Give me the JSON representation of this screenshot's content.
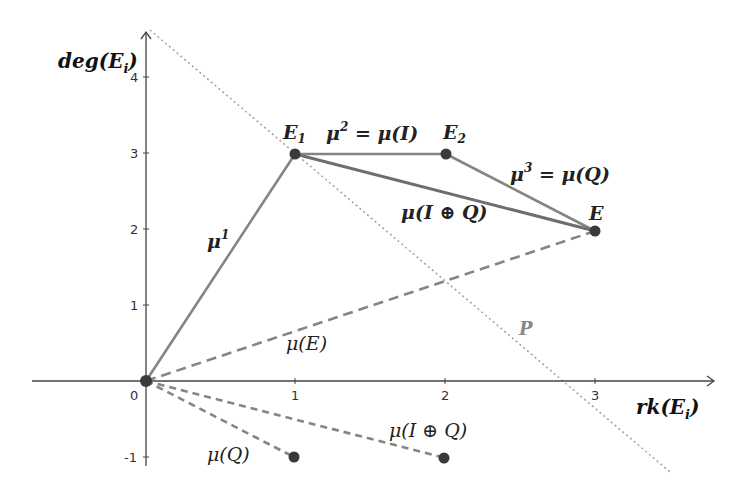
{
  "diagram": {
    "axes": {
      "x_label": "rk(E_i)",
      "x_label_main": "rk(E",
      "x_label_sub": "i",
      "x_label_close": ")",
      "y_label_main": "deg(E",
      "y_label_sub": "i",
      "y_label_close": ")",
      "x_ticks": [
        "0",
        "1",
        "2",
        "3"
      ],
      "y_ticks": [
        "4",
        "3",
        "2",
        "1",
        "-1"
      ]
    },
    "points": [
      {
        "name": "0",
        "x": 0,
        "y": 0
      },
      {
        "name": "E1",
        "x": 1,
        "y": 3,
        "label_main": "E",
        "label_sub": "1"
      },
      {
        "name": "E2",
        "x": 2,
        "y": 3,
        "label_main": "E",
        "label_sub": "2"
      },
      {
        "name": "E",
        "x": 3,
        "y": 2,
        "label_main": "E"
      },
      {
        "name": "mu(Q)",
        "x": 1,
        "y": -1
      },
      {
        "name": "mu(I+Q)",
        "x": 2,
        "y": -1
      }
    ],
    "segments": [
      {
        "from": [
          0,
          0
        ],
        "to": [
          1,
          3
        ],
        "style": "solid",
        "label": "μ¹"
      },
      {
        "from": [
          1,
          3
        ],
        "to": [
          2,
          3
        ],
        "style": "solid",
        "label": "μ² = μ(I)"
      },
      {
        "from": [
          2,
          3
        ],
        "to": [
          3,
          2
        ],
        "style": "solid",
        "label": "μ³ = μ(Q)"
      },
      {
        "from": [
          1,
          3
        ],
        "to": [
          3,
          2
        ],
        "style": "solid",
        "label": "μ(I ⊕ Q)"
      },
      {
        "from": [
          0,
          0
        ],
        "to": [
          3,
          2
        ],
        "style": "dashed",
        "label": "μ(E)"
      },
      {
        "from": [
          0,
          0
        ],
        "to": [
          1,
          -1
        ],
        "style": "dashed",
        "label": "μ(Q)"
      },
      {
        "from": [
          0,
          0
        ],
        "to": [
          2,
          -1
        ],
        "style": "dashed",
        "label": "μ(I ⊕ Q)"
      }
    ],
    "line_P": {
      "label": "P",
      "style": "dotted"
    },
    "labels": {
      "mu1_main": "μ",
      "mu1_sup": "1",
      "mu2_main": "μ",
      "mu2_sup": "2",
      "mu2_rest": " = μ(I)",
      "mu3_main": "μ",
      "mu3_sup": "3",
      "mu3_rest": " = μ(Q)",
      "mu_IQ_upper": "μ(I ⊕ Q)",
      "mu_E": "μ(E)",
      "mu_Q": "μ(Q)",
      "mu_IQ_lower": "μ(I ⊕ Q)",
      "P": "P"
    },
    "colors": {
      "axis": "#444444",
      "segment": "#808080",
      "point": "#3a3a3a",
      "dotted": "#999999"
    }
  }
}
